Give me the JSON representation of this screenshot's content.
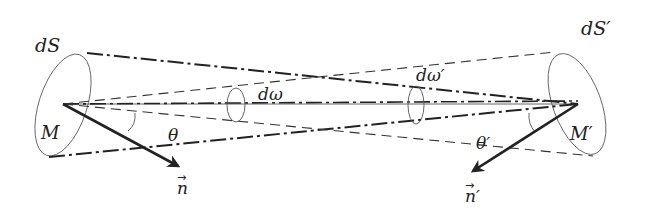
{
  "diagram": {
    "labels": {
      "dS": "dS",
      "dS_prime": "dS′",
      "M": "M",
      "M_prime": "M′",
      "d_omega": "dω",
      "d_omega_prime": "dω′",
      "theta": "θ",
      "theta_prime": "θ′",
      "n": "n",
      "n_prime": "n′",
      "vec_arrow": "→"
    },
    "nodes": [
      {
        "id": "M",
        "label": "M",
        "x": 63,
        "y": 104
      },
      {
        "id": "M_prime",
        "label": "M′",
        "x": 578,
        "y": 104
      }
    ],
    "surfaces": [
      {
        "id": "dS",
        "cx": 63,
        "cy": 105,
        "rx": 26,
        "ry": 53,
        "tilt_deg": 20
      },
      {
        "id": "dS_prime",
        "cx": 576,
        "cy": 104,
        "rx": 26,
        "ry": 53,
        "tilt_deg": -22
      }
    ],
    "edges": [
      {
        "from": "M",
        "to": "M_prime",
        "style": "solid",
        "meaning": "axis"
      },
      {
        "from": "dS rim",
        "to": "M_prime",
        "style": "dash-dot",
        "meaning": "cone dω′"
      },
      {
        "from": "M",
        "to": "dS′ rim",
        "style": "dashed",
        "meaning": "cone dω"
      },
      {
        "from": "M",
        "to": "n",
        "style": "thick-arrow",
        "meaning": "normal n"
      },
      {
        "from": "M_prime",
        "to": "n_prime",
        "style": "thick-arrow",
        "meaning": "normal n′"
      }
    ],
    "colors": {
      "line": "#222222",
      "thin": "#555555",
      "background": "#ffffff"
    }
  }
}
